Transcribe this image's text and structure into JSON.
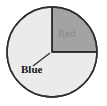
{
  "figure": {
    "width": 107,
    "height": 106,
    "background_color": "#ffffff",
    "type": "pie-chart-diagram"
  },
  "circle": {
    "center_x": 52,
    "center_y": 52,
    "radius": 45,
    "outline_color": "#2e2e2e",
    "outline_width": 1.4
  },
  "labels": {
    "red": "Red",
    "blue": "Blue"
  },
  "leader_line": {
    "x1": 33,
    "y1": 66,
    "x2": 50,
    "y2": 53,
    "color": "#2e2e2e"
  },
  "chart_data": {
    "type": "pie",
    "title": "",
    "categories": [
      "Red",
      "Blue"
    ],
    "values": [
      25,
      75
    ],
    "labels": [
      "Red",
      "Blue"
    ],
    "value_unit": "percent",
    "colors": [
      "#eceaea",
      "#a3a3a3"
    ],
    "start_angle_deg": 90,
    "direction": "clockwise",
    "slices": [
      {
        "name": "Red",
        "value": 25,
        "fraction": 0.25,
        "angle_deg": 90,
        "start_angle_deg": 0,
        "end_angle_deg": 90,
        "quadrant": "upper-right",
        "fill": "#eceaea",
        "label": "Red",
        "label_color": "#8a8a8a",
        "label_bold": false,
        "label_inside": true
      },
      {
        "name": "Blue",
        "value": 75,
        "fraction": 0.75,
        "angle_deg": 270,
        "start_angle_deg": 90,
        "end_angle_deg": 360,
        "quadrant": "upper-left,lower-left,lower-right",
        "fill": "#a3a3a3",
        "label": "Blue",
        "label_color": "#141414",
        "label_bold": true,
        "label_inside": false
      }
    ],
    "legend": false,
    "grid": false,
    "xlabel": "",
    "ylabel": ""
  },
  "radii": [
    {
      "name": "vertical-radius",
      "angle_deg": 90,
      "to_x": 52,
      "to_y": 7
    },
    {
      "name": "horizontal-radius",
      "angle_deg": 0,
      "to_x": 97,
      "to_y": 52
    }
  ]
}
